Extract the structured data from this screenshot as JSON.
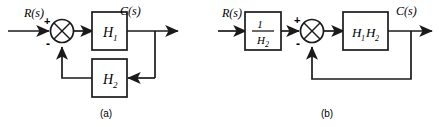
{
  "figure": {
    "stroke_color": "#1a1a1a",
    "background_color": "#ffffff",
    "panels": [
      {
        "id": "a",
        "caption": "(a)",
        "input_label": "R(s)",
        "output_label": "C(s)",
        "summing_junction": {
          "name": "summing-junction-a",
          "plus_sign": "+",
          "minus_sign": "-",
          "plus_input": "R(s)",
          "minus_input": "feedback"
        },
        "blocks": [
          {
            "name": "forward-block-h1",
            "label": "H",
            "sub": "1",
            "position": "forward-path"
          },
          {
            "name": "feedback-block-h2",
            "label": "H",
            "sub": "2",
            "position": "feedback-path"
          }
        ]
      },
      {
        "id": "b",
        "caption": "(b)",
        "input_label": "R(s)",
        "output_label": "C(s)",
        "summing_junction": {
          "name": "summing-junction-b",
          "plus_sign": "+",
          "minus_sign": "-",
          "plus_input": "1/H2 output",
          "minus_input": "feedback"
        },
        "blocks": [
          {
            "name": "input-block-inv-h2",
            "label_numerator": "1",
            "label_denominator": "H",
            "sub": "2",
            "position": "input-path"
          },
          {
            "name": "forward-block-h1h2",
            "label_first": "H",
            "sub_first": "1",
            "label_second": "H",
            "sub_second": "2",
            "position": "forward-path"
          }
        ]
      }
    ]
  }
}
